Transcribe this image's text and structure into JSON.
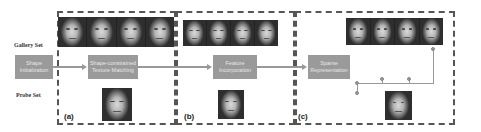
{
  "labels": {
    "gallery_set": "Gallery Set",
    "probe_set": "Probe Set"
  },
  "stages": [
    {
      "id": "shape-initialization",
      "text": "Shape\nInitialization"
    },
    {
      "id": "shape-constrained-texture-matching",
      "text": "Shape-constrained\nTexture Matching"
    },
    {
      "id": "feature-incorporation",
      "text": "Feature\nIncorporation"
    },
    {
      "id": "sparse-representation",
      "text": "Sparse\nRepresentation"
    }
  ],
  "sections": {
    "a": "(a)",
    "b": "(b)",
    "c": "(c)"
  },
  "images": {
    "gallery_faces_a": [
      "face-1",
      "face-2",
      "face-3",
      "face-4"
    ],
    "gallery_faces_b": [
      "face-1",
      "face-2",
      "face-3",
      "face-4"
    ],
    "gallery_faces_c": [
      "face-1",
      "face-2",
      "face-3",
      "face-4"
    ],
    "probe_face": "probe-face"
  },
  "colors": {
    "box_fill": "#9a9a9a",
    "connector": "#999999",
    "dash_border": "#555555"
  }
}
